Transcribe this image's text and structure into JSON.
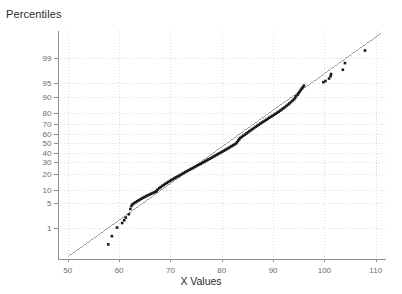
{
  "chart_data": {
    "type": "scatter",
    "title": "",
    "ylabel": "Percentiles",
    "xlabel": "X Values",
    "plot_kind": "normal-probability-plot",
    "grid": true,
    "legend": null,
    "xlim": [
      48,
      112
    ],
    "xticks": [
      50,
      60,
      70,
      80,
      90,
      100,
      110
    ],
    "xtick_labels": [
      "50",
      "60",
      "70",
      "80",
      "90",
      "100",
      "110"
    ],
    "yticks_percentile": [
      1,
      5,
      10,
      20,
      30,
      40,
      50,
      60,
      70,
      80,
      90,
      95,
      99
    ],
    "ytick_labels": [
      "1",
      "5",
      "10",
      "20",
      "30",
      "40",
      "50",
      "60",
      "70",
      "80",
      "90",
      "95",
      "99"
    ],
    "ylim_percentile": [
      0.08,
      99.9
    ],
    "marker": {
      "shape": "square",
      "color": "#1a1a1a",
      "size_px": 2.6
    },
    "reference_line": {
      "color": "#8a8a8a",
      "width_px": 0.8,
      "x_start": 50.2,
      "y_start_percentile": 0.1,
      "x_end": 111.0,
      "y_end_percentile": 99.87
    },
    "gridline_color": "#dcdcdc",
    "axis_color": "#8f8f8f",
    "series": [
      {
        "name": "sample",
        "points": [
          [
            57.9,
            0.28
          ],
          [
            58.6,
            0.55
          ],
          [
            59.6,
            1.05
          ],
          [
            60.6,
            1.45
          ],
          [
            61.0,
            1.75
          ],
          [
            61.3,
            2.1
          ],
          [
            61.9,
            2.6
          ],
          [
            62.2,
            3.6
          ],
          [
            62.4,
            4.3
          ],
          [
            62.6,
            4.7
          ],
          [
            62.9,
            5.0
          ],
          [
            63.2,
            5.3
          ],
          [
            63.5,
            5.6
          ],
          [
            63.8,
            5.9
          ],
          [
            64.1,
            6.2
          ],
          [
            64.4,
            6.5
          ],
          [
            64.7,
            6.8
          ],
          [
            65.0,
            7.1
          ],
          [
            65.3,
            7.4
          ],
          [
            65.6,
            7.7
          ],
          [
            65.9,
            8.0
          ],
          [
            66.2,
            8.3
          ],
          [
            66.5,
            8.6
          ],
          [
            66.8,
            8.9
          ],
          [
            67.1,
            9.2
          ],
          [
            67.3,
            9.6
          ],
          [
            67.5,
            10.2
          ],
          [
            67.8,
            10.9
          ],
          [
            68.1,
            11.5
          ],
          [
            68.4,
            12.1
          ],
          [
            68.7,
            12.7
          ],
          [
            69.0,
            13.3
          ],
          [
            69.3,
            13.9
          ],
          [
            69.6,
            14.5
          ],
          [
            69.9,
            15.1
          ],
          [
            70.2,
            15.7
          ],
          [
            70.5,
            16.3
          ],
          [
            70.8,
            17.0
          ],
          [
            71.1,
            17.6
          ],
          [
            71.4,
            18.2
          ],
          [
            71.7,
            18.8
          ],
          [
            72.0,
            19.4
          ],
          [
            72.3,
            20.1
          ],
          [
            72.6,
            20.8
          ],
          [
            72.9,
            21.5
          ],
          [
            73.2,
            22.2
          ],
          [
            73.5,
            22.9
          ],
          [
            73.8,
            23.6
          ],
          [
            74.1,
            24.3
          ],
          [
            74.4,
            25.0
          ],
          [
            74.7,
            25.8
          ],
          [
            75.0,
            26.5
          ],
          [
            75.3,
            27.3
          ],
          [
            75.6,
            28.0
          ],
          [
            75.9,
            28.8
          ],
          [
            76.2,
            29.6
          ],
          [
            76.5,
            30.4
          ],
          [
            76.8,
            31.2
          ],
          [
            77.1,
            32.0
          ],
          [
            77.4,
            32.9
          ],
          [
            77.7,
            33.7
          ],
          [
            78.0,
            34.6
          ],
          [
            78.3,
            35.5
          ],
          [
            78.6,
            36.4
          ],
          [
            78.9,
            37.3
          ],
          [
            79.2,
            38.2
          ],
          [
            79.5,
            39.1
          ],
          [
            79.8,
            40.0
          ],
          [
            80.1,
            40.9
          ],
          [
            80.4,
            41.9
          ],
          [
            80.7,
            42.8
          ],
          [
            81.0,
            43.8
          ],
          [
            81.3,
            44.8
          ],
          [
            81.6,
            45.8
          ],
          [
            81.9,
            46.8
          ],
          [
            82.2,
            47.8
          ],
          [
            82.5,
            48.8
          ],
          [
            82.8,
            49.9
          ],
          [
            83.0,
            51.2
          ],
          [
            83.2,
            53.0
          ],
          [
            83.4,
            54.5
          ],
          [
            83.6,
            55.8
          ],
          [
            83.9,
            57.0
          ],
          [
            84.2,
            58.2
          ],
          [
            84.5,
            59.4
          ],
          [
            84.8,
            60.6
          ],
          [
            85.1,
            61.8
          ],
          [
            85.4,
            63.0
          ],
          [
            85.7,
            64.1
          ],
          [
            86.0,
            65.2
          ],
          [
            86.3,
            66.3
          ],
          [
            86.6,
            67.4
          ],
          [
            86.9,
            68.4
          ],
          [
            87.2,
            69.4
          ],
          [
            87.5,
            70.4
          ],
          [
            87.8,
            71.4
          ],
          [
            88.1,
            72.3
          ],
          [
            88.4,
            73.2
          ],
          [
            88.7,
            74.1
          ],
          [
            89.0,
            75.0
          ],
          [
            89.3,
            75.9
          ],
          [
            89.6,
            76.7
          ],
          [
            89.9,
            77.5
          ],
          [
            90.2,
            78.3
          ],
          [
            90.5,
            79.1
          ],
          [
            90.8,
            79.9
          ],
          [
            91.1,
            80.7
          ],
          [
            91.4,
            81.5
          ],
          [
            91.7,
            82.3
          ],
          [
            92.0,
            83.1
          ],
          [
            92.3,
            83.9
          ],
          [
            92.6,
            84.7
          ],
          [
            92.9,
            85.5
          ],
          [
            93.2,
            86.3
          ],
          [
            93.5,
            87.1
          ],
          [
            93.8,
            87.9
          ],
          [
            94.1,
            88.6
          ],
          [
            94.3,
            89.4
          ],
          [
            94.5,
            90.2
          ],
          [
            94.8,
            90.9
          ],
          [
            95.0,
            91.6
          ],
          [
            95.2,
            92.2
          ],
          [
            95.4,
            92.8
          ],
          [
            95.6,
            93.3
          ],
          [
            95.8,
            93.8
          ],
          [
            96.0,
            94.3
          ],
          [
            99.8,
            95.3
          ],
          [
            100.2,
            95.6
          ],
          [
            100.9,
            96.2
          ],
          [
            101.2,
            96.7
          ],
          [
            101.3,
            97.1
          ],
          [
            103.6,
            97.8
          ],
          [
            104.0,
            98.6
          ],
          [
            107.9,
            99.45
          ]
        ]
      }
    ]
  }
}
